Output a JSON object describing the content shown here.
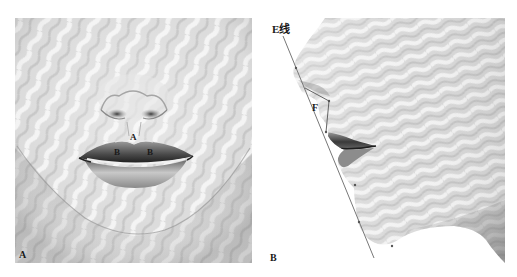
{
  "figure": {
    "panels": [
      {
        "id": "A",
        "view": "frontal view of lower face (nose, lips, chin)",
        "corner_label": "A",
        "annotations": [
          {
            "label": "A",
            "position": "upper lip, cupid's bow peak (philtrum center)"
          },
          {
            "label": "B",
            "position": "upper lip left tubercle"
          },
          {
            "label": "B",
            "position": "upper lip right tubercle"
          }
        ]
      },
      {
        "id": "B",
        "view": "lateral profile of lower face",
        "corner_label": "B",
        "annotations": [
          {
            "label": "E线",
            "position": "top of esthetic line (nose tip to chin)"
          },
          {
            "label": "F",
            "position": "triangle between nose tip, subnasale and upper lip"
          }
        ]
      }
    ]
  },
  "labels": {
    "panel_a_corner": "A",
    "panel_b_corner": "B",
    "lip_a": "A",
    "lip_b_left": "B",
    "lip_b_right": "B",
    "e_line": "E线",
    "triangle_f": "F"
  }
}
